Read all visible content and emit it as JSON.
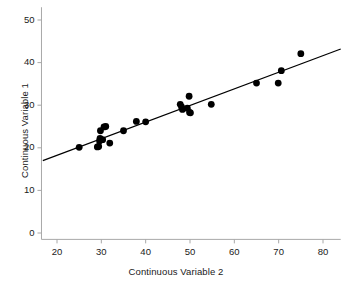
{
  "chart_data": {
    "type": "scatter",
    "title": "",
    "xlabel": "Continuous Variable 2",
    "ylabel": "Continuous Variable 1",
    "xlim": [
      16.5,
      84
    ],
    "ylim": [
      -1.5,
      53
    ],
    "xticks": [
      20,
      30,
      40,
      50,
      60,
      70,
      80
    ],
    "yticks": [
      0,
      10,
      20,
      30,
      40,
      50
    ],
    "xtick_labels": [
      "20",
      "30",
      "40",
      "50",
      "60",
      "70",
      "80"
    ],
    "ytick_labels": [
      "0",
      "10",
      "20",
      "30",
      "40",
      "50"
    ],
    "grid": false,
    "legend": false,
    "marker_color": "#000000",
    "axis_color": "#a8a8a8",
    "tick_label_color": "#1a1a1a",
    "background_color": "#ffffff",
    "points": [
      {
        "x": 25.0,
        "y": 20.1
      },
      {
        "x": 29.1,
        "y": 20.2
      },
      {
        "x": 29.4,
        "y": 20.3
      },
      {
        "x": 29.6,
        "y": 21.6
      },
      {
        "x": 29.7,
        "y": 22.2
      },
      {
        "x": 29.8,
        "y": 24.0
      },
      {
        "x": 30.3,
        "y": 21.9
      },
      {
        "x": 30.6,
        "y": 24.9
      },
      {
        "x": 31.0,
        "y": 25.0
      },
      {
        "x": 31.9,
        "y": 21.1
      },
      {
        "x": 35.0,
        "y": 24.0
      },
      {
        "x": 37.9,
        "y": 26.2
      },
      {
        "x": 40.0,
        "y": 26.1
      },
      {
        "x": 47.8,
        "y": 30.2
      },
      {
        "x": 48.1,
        "y": 29.6
      },
      {
        "x": 48.3,
        "y": 29.0
      },
      {
        "x": 49.4,
        "y": 29.3
      },
      {
        "x": 49.8,
        "y": 32.1
      },
      {
        "x": 49.9,
        "y": 28.3
      },
      {
        "x": 50.1,
        "y": 28.2
      },
      {
        "x": 54.8,
        "y": 30.2
      },
      {
        "x": 65.0,
        "y": 35.2
      },
      {
        "x": 69.9,
        "y": 35.2
      },
      {
        "x": 70.6,
        "y": 38.1
      },
      {
        "x": 75.0,
        "y": 42.1
      }
    ],
    "fit_line": {
      "type": "linear-regression",
      "x_start": 16.8,
      "y_start": 17.0,
      "x_end": 84.0,
      "y_end": 43.2,
      "color": "#000000"
    }
  }
}
